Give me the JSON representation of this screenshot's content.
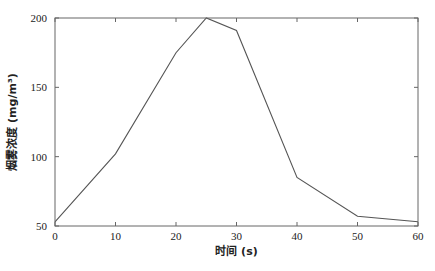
{
  "chart_data": {
    "type": "line",
    "title": "",
    "xlabel": "时间 (s)",
    "ylabel": "烟雾浓度 (mg/m³)",
    "xlim": [
      0,
      60
    ],
    "ylim": [
      50,
      200
    ],
    "xticks": [
      0,
      10,
      20,
      30,
      40,
      50,
      60
    ],
    "yticks": [
      50,
      100,
      150,
      200
    ],
    "grid": false,
    "legend": null,
    "series": [
      {
        "name": "烟雾浓度",
        "color": "#555555",
        "x": [
          0,
          10,
          20,
          25,
          30,
          40,
          50,
          60
        ],
        "y": [
          53,
          102,
          175,
          200,
          191,
          85,
          57,
          53
        ]
      }
    ]
  },
  "labels": {
    "xlabel": "时间 (s)",
    "ylabel": "烟雾浓度 (mg/m³)"
  }
}
